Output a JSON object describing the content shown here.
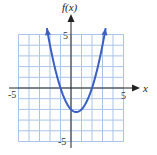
{
  "chart_data": {
    "type": "line",
    "title": "",
    "xlabel": "x",
    "ylabel": "f(x)",
    "xlim": [
      -5,
      5
    ],
    "ylim": [
      -5,
      5
    ],
    "grid": true,
    "grid_step": 1,
    "x_tick_labels": [
      "-5",
      "5"
    ],
    "y_tick_labels": [
      "5",
      "-5"
    ],
    "series": [
      {
        "name": "f(x) = x^2 - x - 2",
        "function": "x^2 - x - 2",
        "vertex": [
          0.5,
          -2.25
        ],
        "x_intercepts": [
          -1,
          2
        ],
        "y_intercept": -2,
        "x_range": [
          -2.3,
          3.3
        ],
        "arrows_at_ends": true,
        "x": [
          -2.3,
          -2,
          -1.5,
          -1,
          -0.5,
          0,
          0.5,
          1,
          1.5,
          2,
          2.5,
          3,
          3.3
        ],
        "values": [
          5.59,
          4,
          1.75,
          0,
          -1.25,
          -2,
          -2.25,
          -2,
          -1.25,
          0,
          1.75,
          4,
          5.59
        ]
      }
    ],
    "legend": null
  },
  "labels": {
    "y_axis": "f(x)",
    "x_axis": "x",
    "x_min_tick": "-5",
    "x_max_tick": "5",
    "y_max_tick": "5",
    "y_min_tick": "-5"
  },
  "colors": {
    "curve": "#3a5fc0",
    "grid": "#a9c4e8",
    "axis": "#222222"
  }
}
